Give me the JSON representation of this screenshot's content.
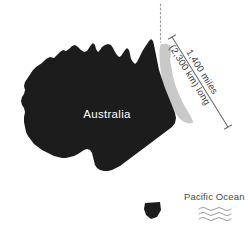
{
  "map": {
    "title": "Australia east coast length diagram",
    "country_label": "Australia",
    "ocean_label": "Pacific Ocean",
    "annotation": {
      "line1": "1,400 miles",
      "line2": "(2,300 km) long"
    },
    "colors": {
      "landmass": "#1c1c1c",
      "highlight_strip": "#c9c9c9",
      "background": "#ffffff",
      "annotation_text": "#3c3c3c",
      "ocean_text": "#4a4a4a",
      "leader_line": "#6e6e6e",
      "country_text": "#ffffff"
    },
    "icons": {
      "water": "ocean-waves-icon",
      "guide": "dotted-guide-line-icon",
      "measure": "measurement-line-icon"
    }
  }
}
